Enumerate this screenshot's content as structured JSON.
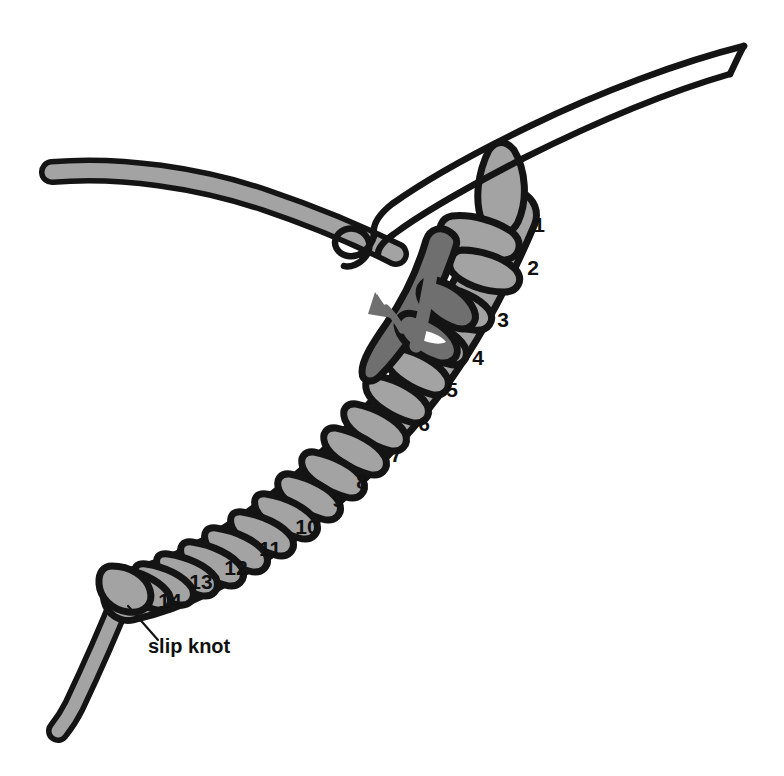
{
  "figure": {
    "background_color": "#ffffff",
    "width": 784,
    "height": 776
  },
  "colors": {
    "yarn_light": "#a3a3a3",
    "yarn_dark": "#6f6f6f",
    "outline": "#141414",
    "hook": "#ffffff",
    "arrow": "#6f6f6f",
    "text": "#111111"
  },
  "stitch_numbers": [
    {
      "label": "1",
      "x": 539,
      "y": 226
    },
    {
      "label": "2",
      "x": 533,
      "y": 269
    },
    {
      "label": "3",
      "x": 503,
      "y": 321
    },
    {
      "label": "4",
      "x": 478,
      "y": 359
    },
    {
      "label": "5",
      "x": 452,
      "y": 391
    },
    {
      "label": "6",
      "x": 424,
      "y": 425
    },
    {
      "label": "7",
      "x": 396,
      "y": 456
    },
    {
      "label": "8",
      "x": 362,
      "y": 483
    },
    {
      "label": "9",
      "x": 338,
      "y": 501
    },
    {
      "label": "10",
      "x": 307,
      "y": 528
    },
    {
      "label": "11",
      "x": 270,
      "y": 550
    },
    {
      "label": "12",
      "x": 236,
      "y": 569
    },
    {
      "label": "13",
      "x": 201,
      "y": 583
    },
    {
      "label": "14",
      "x": 170,
      "y": 602
    }
  ],
  "annotations": [
    {
      "name": "slip-knot-label",
      "text": "slip knot",
      "x": 148,
      "y": 648
    }
  ],
  "elements": {
    "hook": "crochet-hook",
    "working_yarn": "working-yarn-strand",
    "chain": "foundation-chain",
    "tail_yarn": "yarn-tail",
    "arrow": "direction-arrow"
  }
}
